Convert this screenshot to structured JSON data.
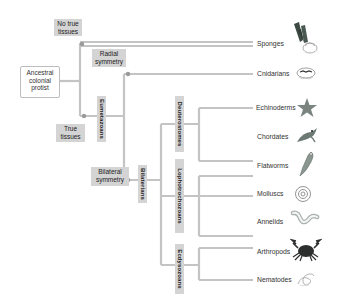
{
  "diagram": {
    "type": "phylogenetic-tree",
    "line_color": "#c4c4c4",
    "node_color": "#9a9a9a",
    "label_box_color": "#d4d4d4"
  },
  "root": {
    "label": "Ancestral colonial protist",
    "lines": [
      "Ancestral",
      "colonial",
      "protist"
    ]
  },
  "traits": {
    "no_true_tissues": {
      "lines": [
        "No true",
        "tissues"
      ]
    },
    "true_tissues": {
      "lines": [
        "True",
        "tissues"
      ]
    },
    "radial_symmetry": {
      "lines": [
        "Radial",
        "symmetry"
      ]
    },
    "bilateral_symmetry": {
      "lines": [
        "Bilateral",
        "symmetry"
      ]
    }
  },
  "clades": {
    "eumetazoans": "Eumetazoans",
    "bilaterians": "Bilaterians",
    "deuterostomes": "Deuterostomes",
    "lophotrochozoans": "Lophotrochozoans",
    "ecdysozoans": "Ecdysozoans"
  },
  "taxa": [
    {
      "name": "Sponges",
      "icon": "sponge-icon"
    },
    {
      "name": "Cnidarians",
      "icon": "jellyfish-icon"
    },
    {
      "name": "Echinoderms",
      "icon": "starfish-icon"
    },
    {
      "name": "Chordates",
      "icon": "fish-icon"
    },
    {
      "name": "Flatworms",
      "icon": "flatworm-icon"
    },
    {
      "name": "Molluscs",
      "icon": "snail-icon"
    },
    {
      "name": "Annelids",
      "icon": "worm-icon"
    },
    {
      "name": "Arthropods",
      "icon": "crab-icon"
    },
    {
      "name": "Nematodes",
      "icon": "nematode-icon"
    }
  ]
}
